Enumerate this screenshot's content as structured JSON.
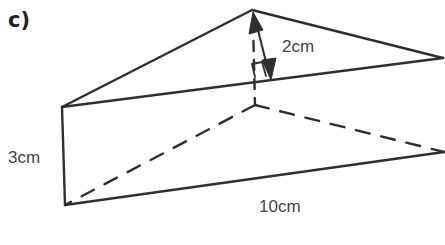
{
  "figure": {
    "part_label": "c)",
    "shape": "triangular prism",
    "labels": {
      "height_triangle": "2cm",
      "prism_height": "3cm",
      "length": "10cm"
    },
    "colors": {
      "line": "#2f2f2f",
      "text": "#444444",
      "background": "#ffffff"
    }
  }
}
